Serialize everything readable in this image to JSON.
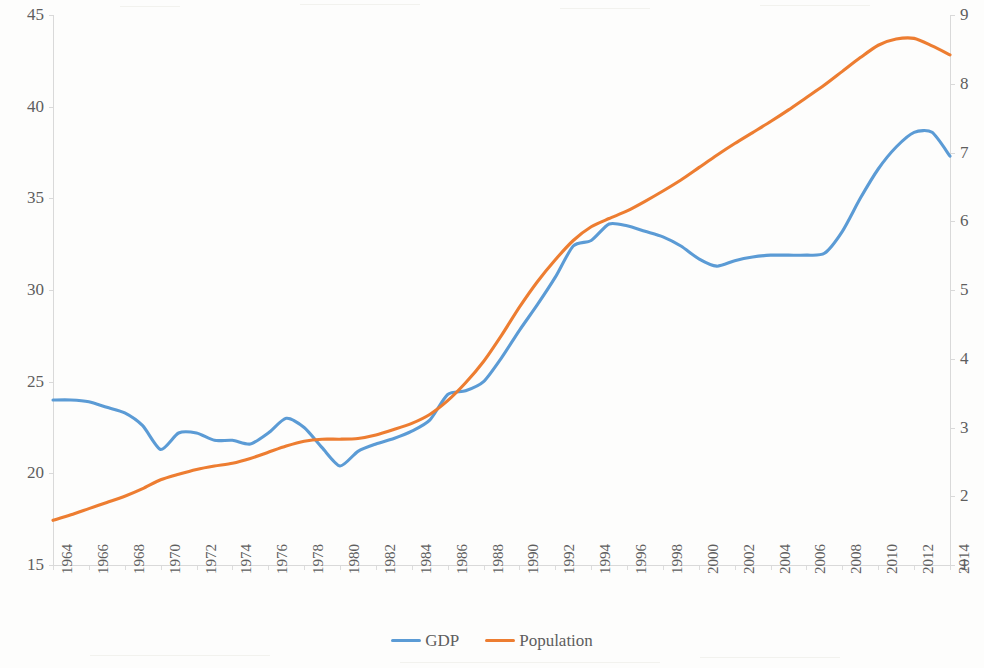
{
  "chart_data": {
    "type": "line",
    "title": "",
    "xlabel": "",
    "grid": false,
    "legend_position": "bottom",
    "x": [
      1964,
      1965,
      1966,
      1967,
      1968,
      1969,
      1970,
      1971,
      1972,
      1973,
      1974,
      1975,
      1976,
      1977,
      1978,
      1979,
      1980,
      1981,
      1982,
      1983,
      1984,
      1985,
      1986,
      1987,
      1988,
      1989,
      1990,
      1991,
      1992,
      1993,
      1994,
      1995,
      1996,
      1997,
      1998,
      1999,
      2000,
      2001,
      2002,
      2003,
      2004,
      2005,
      2006,
      2007,
      2008,
      2009,
      2010,
      2011,
      2012,
      2013,
      2014
    ],
    "axes": {
      "left": {
        "label": "GDP",
        "ticks": [
          15,
          20,
          25,
          30,
          35,
          40,
          45
        ],
        "ylim": [
          15,
          45
        ],
        "series": "GDP"
      },
      "right": {
        "label": "Population",
        "ticks": [
          1,
          2,
          3,
          4,
          5,
          6,
          7,
          8,
          9
        ],
        "ylim": [
          1,
          9
        ],
        "series": "Population"
      },
      "x": {
        "tick_labels": [
          "1964",
          "1966",
          "1968",
          "1970",
          "1972",
          "1974",
          "1976",
          "1978",
          "1980",
          "1982",
          "1984",
          "1986",
          "1988",
          "1990",
          "1992",
          "1994",
          "1996",
          "1998",
          "2000",
          "2002",
          "2004",
          "2006",
          "2008",
          "2010",
          "2012",
          "2014"
        ],
        "xlim": [
          1964,
          2014
        ]
      }
    },
    "series": [
      {
        "name": "GDP",
        "color": "#5B9BD5",
        "axis": "left",
        "values": [
          24.0,
          24.0,
          23.9,
          23.6,
          23.3,
          22.6,
          21.3,
          22.2,
          22.2,
          21.8,
          21.8,
          21.6,
          22.2,
          23.0,
          22.5,
          21.4,
          20.4,
          21.2,
          21.6,
          21.9,
          22.3,
          22.9,
          24.3,
          24.5,
          25.0,
          26.3,
          27.8,
          29.2,
          30.7,
          32.4,
          32.7,
          33.6,
          33.5,
          33.2,
          32.9,
          32.4,
          31.7,
          31.3,
          31.6,
          31.8,
          31.9,
          31.9,
          31.9,
          32.0,
          33.2,
          35.0,
          36.6,
          37.8,
          38.6,
          38.6,
          37.3
        ]
      },
      {
        "name": "Population",
        "color": "#ED7D31",
        "axis": "right",
        "values": [
          1.65,
          1.73,
          1.82,
          1.91,
          2.0,
          2.11,
          2.24,
          2.32,
          2.39,
          2.44,
          2.48,
          2.55,
          2.64,
          2.73,
          2.8,
          2.83,
          2.83,
          2.84,
          2.89,
          2.97,
          3.06,
          3.19,
          3.39,
          3.65,
          3.96,
          4.34,
          4.75,
          5.12,
          5.44,
          5.72,
          5.92,
          6.04,
          6.15,
          6.29,
          6.44,
          6.6,
          6.78,
          6.96,
          7.13,
          7.29,
          7.45,
          7.62,
          7.8,
          7.98,
          8.18,
          8.38,
          8.56,
          8.65,
          8.66,
          8.55,
          8.42
        ]
      }
    ],
    "legend": [
      {
        "label": "GDP",
        "color": "#5B9BD5"
      },
      {
        "label": "Population",
        "color": "#ED7D31"
      }
    ]
  }
}
